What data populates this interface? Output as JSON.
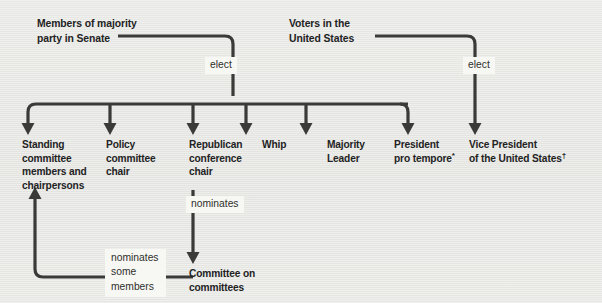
{
  "diagram": {
    "background_color": "#e9e9e6",
    "line_color": "#3a3a38",
    "text_color": "#23231f",
    "edge_label_bg": "#f7f7f4"
  },
  "headers": [
    {
      "id": "members-majority",
      "text": "Members of majority\nparty in Senate"
    },
    {
      "id": "voters-us",
      "text": "Voters in the\nUnited States"
    }
  ],
  "edge_labels": [
    {
      "id": "elect-left",
      "text": "elect"
    },
    {
      "id": "elect-right",
      "text": "elect"
    },
    {
      "id": "nominates",
      "text": "nominates"
    },
    {
      "id": "nominates-some-members",
      "text": "nominates\nsome\nmembers"
    }
  ],
  "nodes": [
    {
      "id": "standing-committee",
      "text": "Standing\ncommittee\nmembers and\nchairpersons",
      "footnote": ""
    },
    {
      "id": "policy-committee-chair",
      "text": "Policy\ncommittee\nchair",
      "footnote": ""
    },
    {
      "id": "republican-conference-chair",
      "text": "Republican\nconference\nchair",
      "footnote": ""
    },
    {
      "id": "whip",
      "text": "Whip",
      "footnote": ""
    },
    {
      "id": "majority-leader",
      "text": "Majority\nLeader",
      "footnote": ""
    },
    {
      "id": "president-pro-tempore",
      "text": "President\npro tempore",
      "footnote": "*"
    },
    {
      "id": "vice-president",
      "text": "Vice President\nof the United States",
      "footnote": "†"
    },
    {
      "id": "committee-on-committees",
      "text": "Committee on\ncommittees",
      "footnote": ""
    }
  ]
}
